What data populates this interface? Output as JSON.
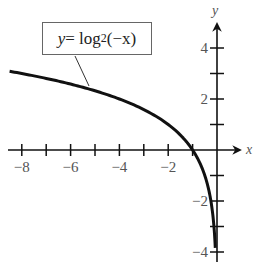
{
  "chart_data": {
    "type": "line",
    "title": "",
    "function": "y = log2(-x)",
    "annotation": {
      "lhs": "y",
      "eq": " = log",
      "base": "2",
      "arg": " (−x)"
    },
    "xlabel": "x",
    "ylabel": "y",
    "xlim": [
      -8.5,
      1
    ],
    "ylim": [
      -4.5,
      5
    ],
    "x_ticks": [
      -8,
      -7,
      -6,
      -5,
      -4,
      -3,
      -2,
      -1
    ],
    "x_tick_labels": [
      {
        "value": -8,
        "label": "−8"
      },
      {
        "value": -6,
        "label": "−6"
      },
      {
        "value": -4,
        "label": "−4"
      },
      {
        "value": -2,
        "label": "−2"
      }
    ],
    "y_ticks": [
      -4,
      -3,
      -2,
      -1,
      1,
      2,
      3,
      4
    ],
    "y_tick_labels": [
      {
        "value": 4,
        "label": "4"
      },
      {
        "value": 2,
        "label": "2"
      },
      {
        "value": -2,
        "label": "−2"
      },
      {
        "value": -4,
        "label": "−4"
      }
    ],
    "grid": false,
    "series": [
      {
        "name": "y = log2(-x)",
        "x": [
          -8.5,
          -8,
          -6,
          -4,
          -3,
          -2,
          -1.5,
          -1,
          -0.5,
          -0.25,
          -0.125,
          -0.0625
        ],
        "y": [
          3.09,
          3,
          2.58,
          2,
          1.58,
          1,
          0.58,
          0,
          -1,
          -2,
          -3,
          -4
        ]
      }
    ]
  },
  "labels": {
    "x_axis_name": "x",
    "y_axis_name": "y",
    "x_ticks": [
      "−8",
      "−6",
      "−4",
      "−2"
    ],
    "y_ticks": [
      "4",
      "2",
      "−2",
      "−4"
    ]
  }
}
